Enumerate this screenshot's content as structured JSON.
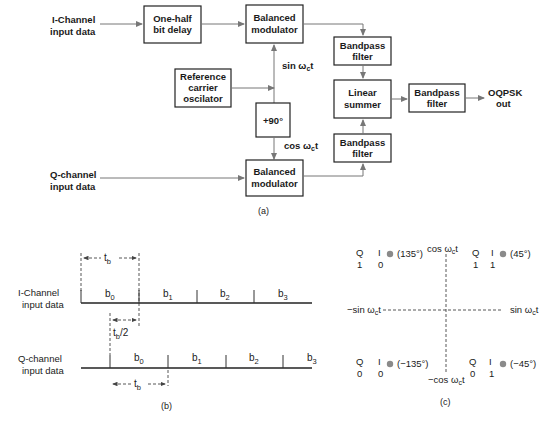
{
  "part_a": {
    "caption": "(a)",
    "inputs": {
      "i_channel": [
        "I-Channel",
        "input data"
      ],
      "q_channel": [
        "Q-channel",
        "input data"
      ]
    },
    "blocks": {
      "half_bit_delay": [
        "One-half",
        "bit delay"
      ],
      "balanced_modulator_top": [
        "Balanced",
        "modulator"
      ],
      "reference_oscillator": [
        "Reference",
        "carrier",
        "oscilator"
      ],
      "phase_shift": "+90°",
      "balanced_modulator_bottom": [
        "Balanced",
        "modulator"
      ],
      "bandpass_top": [
        "Bandpass",
        "filter"
      ],
      "linear_summer": [
        "Linear",
        "summer"
      ],
      "bandpass_bottom": [
        "Bandpass",
        "filter"
      ],
      "bandpass_out": [
        "Bandpass",
        "filter"
      ]
    },
    "signals": {
      "sin": "sin ω",
      "sin_sub": "c",
      "sin_t": "t",
      "cos": "cos ω",
      "cos_sub": "c",
      "cos_t": "t"
    },
    "output": [
      "OQPSK",
      "out"
    ]
  },
  "part_b": {
    "caption": "(b)",
    "i_label": [
      "I-Channel",
      "input data"
    ],
    "q_label": [
      "Q-channel",
      "input data"
    ],
    "tb": "t",
    "tb_sub": "b",
    "half_tb": "t",
    "half_tb_sub": "b",
    "half_tb_suffix": "/2",
    "i_bits": [
      {
        "b": "b",
        "n": "0"
      },
      {
        "b": "b",
        "n": "1"
      },
      {
        "b": "b",
        "n": "2"
      },
      {
        "b": "b",
        "n": "3"
      }
    ],
    "q_bits": [
      {
        "b": "b",
        "n": "0"
      },
      {
        "b": "b",
        "n": "1"
      },
      {
        "b": "b",
        "n": "2"
      },
      {
        "b": "b",
        "n": "3"
      }
    ]
  },
  "part_c": {
    "caption": "(c)",
    "axes": {
      "top": {
        "pre": "cos ω",
        "sub": "c",
        "post": "t"
      },
      "bottom": {
        "pre": "−cos ω",
        "sub": "c",
        "post": "t"
      },
      "left": {
        "pre": "−sin ω",
        "sub": "c",
        "post": "t"
      },
      "right": {
        "pre": "sin ω",
        "sub": "c",
        "post": "t"
      }
    },
    "points": [
      {
        "q": "1",
        "i": "0",
        "phase": "(135°)"
      },
      {
        "q": "1",
        "i": "1",
        "phase": "(45°)"
      },
      {
        "q": "0",
        "i": "0",
        "phase": "(−135°)"
      },
      {
        "q": "0",
        "i": "1",
        "phase": "(−45°)"
      }
    ],
    "col_q": "Q",
    "col_i": "I"
  }
}
